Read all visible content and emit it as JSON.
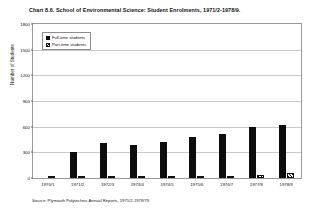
{
  "chart_data": {
    "type": "bar",
    "title": "Chart 8.6.  School of Environmental Science: Student Enrolments, 1971/2-1978/9.",
    "xlabel": "",
    "ylabel": "Number of Students",
    "ylim": [
      0,
      1800
    ],
    "y_ticks": [
      0,
      300,
      600,
      900,
      1200,
      1500,
      1800
    ],
    "grid": true,
    "legend_position": "top-left-inside",
    "categories": [
      "1970/1",
      "1971/2",
      "1972/3",
      "1973/4",
      "1974/5",
      "1975/6",
      "1976/7",
      "1977/8",
      "1978/9"
    ],
    "series": [
      {
        "name": "Full-time students",
        "color": "#0d0d0d",
        "pattern": "solid",
        "values": [
          0,
          300,
          405,
          390,
          425,
          480,
          520,
          600,
          620
        ]
      },
      {
        "name": "Part-time students",
        "color": "#111111",
        "pattern": "diagonal-hatch",
        "values": [
          0,
          0,
          12,
          14,
          16,
          22,
          28,
          38,
          55
        ]
      }
    ],
    "source": "Source: Plymouth Polytechnic Annual Reports, 1971/2-1978/79"
  }
}
